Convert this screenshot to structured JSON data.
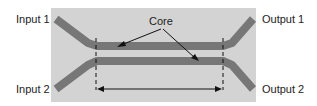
{
  "diagram": {
    "type": "directional-coupler",
    "labels": {
      "input1": "Input 1",
      "input2": "Input 2",
      "output1": "Output 1",
      "output2": "Output 2",
      "core": "Core"
    },
    "colors": {
      "substrate": "#d3d3d3",
      "waveguide": "#777777",
      "text": "#222222",
      "annotation": "#111111"
    }
  }
}
